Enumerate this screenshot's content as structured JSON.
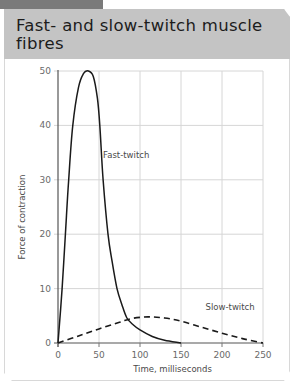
{
  "header": {
    "title": "Fast- and slow-twitch muscle fibres"
  },
  "chart_data": {
    "type": "line",
    "title": "Fast- and slow-twitch muscle fibres",
    "xlabel": "Time, milliseconds",
    "ylabel": "Force of contraction",
    "xlim": [
      0,
      250
    ],
    "ylim": [
      0,
      50
    ],
    "xticks": [
      0,
      50,
      100,
      150,
      200,
      250
    ],
    "yticks": [
      0,
      10,
      20,
      30,
      40,
      50
    ],
    "grid": true,
    "legend": "inline labels",
    "series": [
      {
        "name": "Fast-twitch",
        "style": "solid",
        "x": [
          0,
          5,
          9,
          13,
          18,
          25,
          31,
          37,
          43,
          48,
          51,
          55,
          61,
          66,
          72,
          78,
          84,
          92,
          100,
          115,
          130,
          150
        ],
        "y": [
          0,
          10,
          20,
          30,
          40,
          47,
          49.5,
          50,
          49,
          45,
          40,
          30,
          20,
          15,
          10,
          7,
          4.6,
          3.3,
          2.4,
          1.2,
          0.5,
          0
        ]
      },
      {
        "name": "Slow-twitch",
        "style": "dashed",
        "x": [
          0,
          25,
          50,
          75,
          90,
          110,
          130,
          150,
          175,
          200,
          225,
          250
        ],
        "y": [
          0,
          1.3,
          2.6,
          3.8,
          4.5,
          4.8,
          4.6,
          4.0,
          2.9,
          1.8,
          0.8,
          0
        ]
      }
    ],
    "annotations": [
      {
        "text": "Fast-twitch",
        "x": 55,
        "y": 34
      },
      {
        "text": "Slow-twitch",
        "x": 180,
        "y": 6
      }
    ]
  }
}
